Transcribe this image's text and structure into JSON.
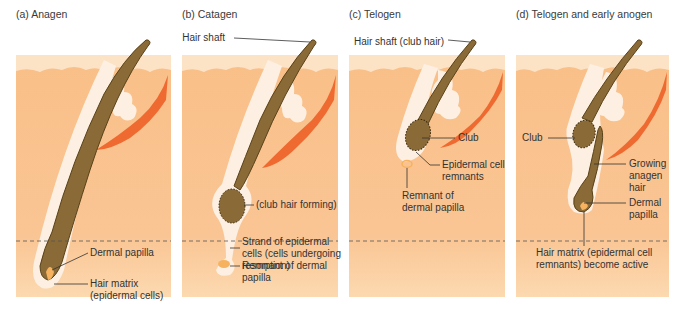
{
  "colors": {
    "dermis": "#f9c28c",
    "dermis_lower": "#fbd5a8",
    "epidermis": "#fde6cc",
    "sheath": "#fdf0e2",
    "hair": "#8a6a36",
    "hair_outline": "#5a4218",
    "muscle": "#ef6a30",
    "papilla": "#f6b25e",
    "leader": "#333333"
  },
  "panels": [
    {
      "id": "a",
      "title": "(a) Anagen",
      "labels": [
        {
          "text": "Dermal papilla"
        },
        {
          "text": "Hair matrix\n(epidermal cells)"
        }
      ]
    },
    {
      "id": "b",
      "title": "(b) Catagen",
      "labels": [
        {
          "text": "Hair shaft"
        },
        {
          "text": "(club hair forming)"
        },
        {
          "text": "Strand of epidermal\ncells (cells undergoing\nresorption)"
        },
        {
          "text": "Remnant of dermal\npapilla"
        }
      ]
    },
    {
      "id": "c",
      "title": "(c) Telogen",
      "labels": [
        {
          "text": "Hair shaft (club hair)"
        },
        {
          "text": "Club"
        },
        {
          "text": "Epidermal cell\nremnants"
        },
        {
          "text": "Remnant of\ndermal papilla"
        }
      ]
    },
    {
      "id": "d",
      "title": "(d) Telogen and early anogen",
      "labels": [
        {
          "text": "Club"
        },
        {
          "text": "Growing\nanagen\nhair"
        },
        {
          "text": "Dermal\npapilla"
        },
        {
          "text": "Hair matrix (epidermal cell\nremnants) become active"
        }
      ]
    }
  ]
}
